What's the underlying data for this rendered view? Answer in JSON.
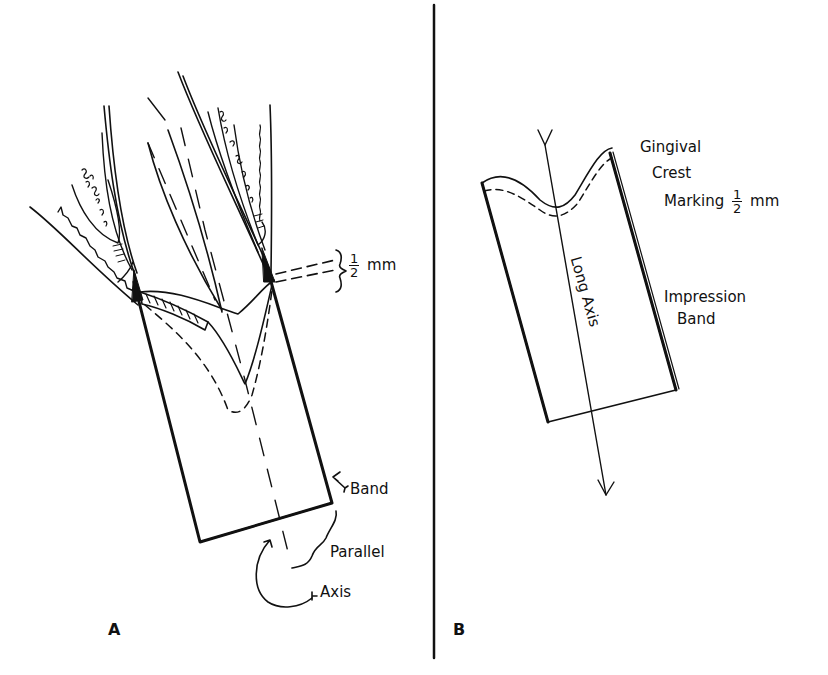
{
  "figure": {
    "panels": [
      {
        "id": "A",
        "letter": "A",
        "labels": {
          "half_mm_num": "1",
          "half_mm_den": "2",
          "half_mm_unit": "mm",
          "band": "Band",
          "parallel": "Parallel",
          "axis": "Axis"
        }
      },
      {
        "id": "B",
        "letter": "B",
        "labels": {
          "gingival": "Gingival",
          "crest": "Crest",
          "marking": "Marking",
          "marking_num": "1",
          "marking_den": "2",
          "marking_unit": "mm",
          "impression": "Impression",
          "band": "Band",
          "long_axis": "Long Axis"
        }
      }
    ],
    "colors": {
      "ink": "#111111",
      "background": "#ffffff"
    }
  }
}
